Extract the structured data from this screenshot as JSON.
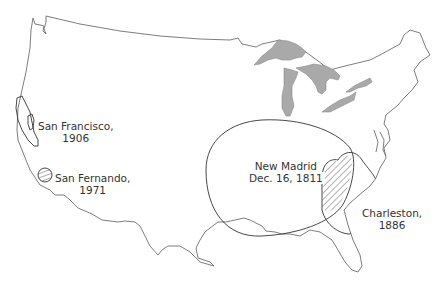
{
  "map": {
    "title": "Major historical earthquakes felt areas, United States",
    "colors": {
      "outline": "#6e6e6e",
      "lakes": "#a9a9a9",
      "hatch": "#444444",
      "background": "#ffffff"
    },
    "zones": [
      {
        "id": "san-francisco",
        "name": "San Francisco,",
        "year": "1906",
        "pattern": "diagonal-hatch"
      },
      {
        "id": "san-fernando",
        "name": "San Fernando,",
        "year": "1971",
        "pattern": "horizontal-hatch"
      },
      {
        "id": "new-madrid",
        "name": "New Madrid",
        "date": "Dec. 16, 1811",
        "pattern": "diagonal-hatch"
      },
      {
        "id": "charleston",
        "name": "Charleston,",
        "year": "1886",
        "pattern": "reverse-diagonal-hatch"
      }
    ]
  }
}
